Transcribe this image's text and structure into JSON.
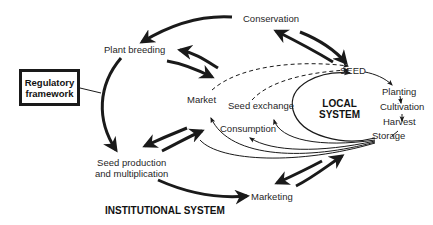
{
  "diagram": {
    "type": "flow-diagram",
    "title": "",
    "colors": {
      "line": "#1a1a1a",
      "background": "#ffffff"
    },
    "regulatory_framework": {
      "label_line1": "Regulatory",
      "label_line2": "framework"
    },
    "institutional_system": {
      "label": "INSTITUTIONAL SYSTEM",
      "nodes": {
        "conservation": "Conservation",
        "plant_breeding": "Plant breeding",
        "seed_production_line1": "Seed production",
        "seed_production_line2": "and multiplication",
        "marketing": "Marketing"
      }
    },
    "local_system": {
      "label_line1": "LOCAL",
      "label_line2": "SYSTEM",
      "nodes": {
        "seed": "SEED",
        "planting": "Planting",
        "cultivation": "Cultivation",
        "harvest": "Harvest",
        "storage": "Storage",
        "market": "Market",
        "seed_exchange": "Seed exchange",
        "consumption": "Consumption"
      }
    },
    "edges": [
      {
        "from": "Conservation",
        "to": "Plant breeding",
        "style": "bold"
      },
      {
        "from": "Conservation",
        "to": "SEED",
        "style": "bold",
        "bidirectional": true
      },
      {
        "from": "Plant breeding",
        "to": "Seed production and multiplication",
        "style": "bold"
      },
      {
        "from": "Plant breeding",
        "to": "Local system (Market)",
        "style": "bold",
        "bidirectional": true
      },
      {
        "from": "Regulatory framework",
        "to": "Plant breeding → Seed production link",
        "style": "thin"
      },
      {
        "from": "Seed production and multiplication",
        "to": "Local system",
        "style": "bold",
        "bidirectional": true
      },
      {
        "from": "Seed production and multiplication",
        "to": "Marketing",
        "style": "bold"
      },
      {
        "from": "Marketing",
        "to": "Storage",
        "style": "bold",
        "bidirectional": true
      },
      {
        "from": "SEED",
        "to": "Planting",
        "style": "thin"
      },
      {
        "from": "Planting",
        "to": "Cultivation",
        "style": "thin"
      },
      {
        "from": "Cultivation",
        "to": "Harvest",
        "style": "thin"
      },
      {
        "from": "Harvest",
        "to": "Storage",
        "style": "thin"
      },
      {
        "from": "Storage",
        "to": "SEED",
        "style": "thin"
      },
      {
        "from": "Storage",
        "to": "Market",
        "style": "thin"
      },
      {
        "from": "Storage",
        "to": "Seed exchange",
        "style": "thin"
      },
      {
        "from": "Storage",
        "to": "Consumption",
        "style": "thin"
      },
      {
        "from": "Market",
        "to": "SEED",
        "style": "dashed"
      },
      {
        "from": "Seed exchange",
        "to": "SEED",
        "style": "dashed"
      }
    ]
  }
}
